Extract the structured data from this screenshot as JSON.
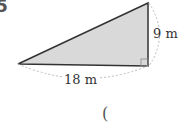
{
  "problem": {
    "number": "5",
    "height_label": "9 m",
    "base_label": "18 m",
    "answer_open": "("
  },
  "colors": {
    "fill": "#d9d9d9",
    "stroke": "#333333",
    "dotted": "#bbbbbb"
  }
}
